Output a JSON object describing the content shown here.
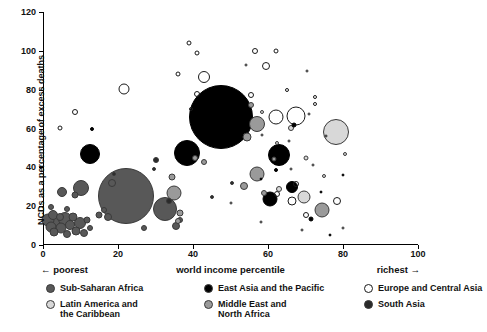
{
  "chart_data": {
    "type": "scatter",
    "title": "",
    "xlabel": "world income percentile",
    "ylabel": "NCDs as a percentage of excess deaths",
    "xlim": [
      0,
      100
    ],
    "ylim": [
      0,
      120
    ],
    "xticks": [
      0,
      20,
      40,
      60,
      80,
      100
    ],
    "yticks": [
      0,
      20,
      40,
      60,
      80,
      100,
      120
    ],
    "grid": false,
    "legend_position": "below",
    "axis_annotations": {
      "left": "← poorest",
      "right": "richest →"
    },
    "series": [
      {
        "name": "Sub-Saharan Africa",
        "color": "#585858",
        "filled": true,
        "points": [
          {
            "x": 1.2,
            "y": 13,
            "r": 6.5
          },
          {
            "x": 2.0,
            "y": 9.5,
            "r": 5.5
          },
          {
            "x": 2.6,
            "y": 15.5,
            "r": 5.0
          },
          {
            "x": 3.4,
            "y": 11,
            "r": 7.5
          },
          {
            "x": 3.0,
            "y": 6.5,
            "r": 4.5
          },
          {
            "x": 4.4,
            "y": 14.5,
            "r": 4.0
          },
          {
            "x": 4.9,
            "y": 8.5,
            "r": 5.5
          },
          {
            "x": 5.8,
            "y": 13.5,
            "r": 7.0
          },
          {
            "x": 6.3,
            "y": 5.5,
            "r": 4.0
          },
          {
            "x": 7.2,
            "y": 10.5,
            "r": 5.0
          },
          {
            "x": 8.0,
            "y": 14.5,
            "r": 4.5
          },
          {
            "x": 8.8,
            "y": 7.0,
            "r": 4.5
          },
          {
            "x": 9.8,
            "y": 11.5,
            "r": 6.0
          },
          {
            "x": 10.8,
            "y": 6.0,
            "r": 4.0
          },
          {
            "x": 11.6,
            "y": 13.0,
            "r": 3.5
          },
          {
            "x": 12.6,
            "y": 9.0,
            "r": 3.0
          },
          {
            "x": 2.2,
            "y": 19.5,
            "r": 3.0
          },
          {
            "x": 6.5,
            "y": 18.5,
            "r": 3.0
          },
          {
            "x": 5.0,
            "y": 27.5,
            "r": 5.0
          },
          {
            "x": 8.4,
            "y": 26.0,
            "r": 3.5
          },
          {
            "x": 10.0,
            "y": 29.5,
            "r": 8.0
          },
          {
            "x": 15.0,
            "y": 15.5,
            "r": 3.5
          },
          {
            "x": 16.2,
            "y": 18.0,
            "r": 3.0
          },
          {
            "x": 17.4,
            "y": 14.5,
            "r": 4.0
          },
          {
            "x": 22.0,
            "y": 25.0,
            "r": 28.0
          },
          {
            "x": 27.0,
            "y": 9.0,
            "r": 3.0
          },
          {
            "x": 32.5,
            "y": 18.5,
            "r": 12.0
          },
          {
            "x": 35.5,
            "y": 10.0,
            "r": 4.0
          },
          {
            "x": 36.5,
            "y": 13.0,
            "r": 3.0
          },
          {
            "x": 18.5,
            "y": 32.0,
            "r": 4.0
          }
        ]
      },
      {
        "name": "East Asia and the Pacific",
        "color": "#000000",
        "filled": true,
        "points": [
          {
            "x": 13.0,
            "y": 59.5,
            "r": 2.0
          },
          {
            "x": 12.5,
            "y": 47.0,
            "r": 10.0
          },
          {
            "x": 38.5,
            "y": 47.5,
            "r": 13.0
          },
          {
            "x": 47.5,
            "y": 66.0,
            "r": 32.0
          },
          {
            "x": 63.0,
            "y": 46.5,
            "r": 11.0
          },
          {
            "x": 60.5,
            "y": 23.5,
            "r": 7.5
          },
          {
            "x": 66.5,
            "y": 30.0,
            "r": 6.0
          },
          {
            "x": 71.5,
            "y": 13.5,
            "r": 2.5
          },
          {
            "x": 76.5,
            "y": 5.0,
            "r": 1.5
          },
          {
            "x": 62.0,
            "y": 38.5,
            "r": 2.0
          },
          {
            "x": 67.0,
            "y": 62.0,
            "r": 2.5
          },
          {
            "x": 58.0,
            "y": 34.0,
            "r": 1.5
          },
          {
            "x": 74.0,
            "y": 27.5,
            "r": 1.5
          },
          {
            "x": 80.0,
            "y": 36.0,
            "r": 1.5
          }
        ]
      },
      {
        "name": "Europe and Central Asia",
        "color": "#ffffff",
        "filled": false,
        "points": [
          {
            "x": 4.5,
            "y": 60.5,
            "r": 2.5
          },
          {
            "x": 8.5,
            "y": 68.5,
            "r": 3.0
          },
          {
            "x": 21.5,
            "y": 80.5,
            "r": 5.5
          },
          {
            "x": 39.0,
            "y": 104.0,
            "r": 2.5
          },
          {
            "x": 41.0,
            "y": 99.0,
            "r": 2.5
          },
          {
            "x": 36.0,
            "y": 88.0,
            "r": 2.5
          },
          {
            "x": 43.0,
            "y": 86.5,
            "r": 6.0
          },
          {
            "x": 41.0,
            "y": 78.0,
            "r": 3.0
          },
          {
            "x": 39.5,
            "y": 70.0,
            "r": 2.0
          },
          {
            "x": 56.5,
            "y": 100.0,
            "r": 3.0
          },
          {
            "x": 62.0,
            "y": 100.0,
            "r": 2.5
          },
          {
            "x": 59.5,
            "y": 92.0,
            "r": 4.0
          },
          {
            "x": 54.0,
            "y": 92.5,
            "r": 1.5
          },
          {
            "x": 70.5,
            "y": 89.5,
            "r": 1.5
          },
          {
            "x": 55.5,
            "y": 77.5,
            "r": 3.0
          },
          {
            "x": 65.0,
            "y": 80.0,
            "r": 2.0
          },
          {
            "x": 72.5,
            "y": 76.0,
            "r": 2.0
          },
          {
            "x": 72.5,
            "y": 72.5,
            "r": 2.0
          },
          {
            "x": 71.0,
            "y": 67.5,
            "r": 1.5
          },
          {
            "x": 67.5,
            "y": 66.5,
            "r": 9.5
          },
          {
            "x": 62.0,
            "y": 66.0,
            "r": 7.5
          },
          {
            "x": 65.5,
            "y": 53.5,
            "r": 1.5
          },
          {
            "x": 75.5,
            "y": 56.0,
            "r": 1.5
          },
          {
            "x": 58.5,
            "y": 56.5,
            "r": 1.5
          },
          {
            "x": 62.5,
            "y": 26.5,
            "r": 3.0
          },
          {
            "x": 67.5,
            "y": 31.5,
            "r": 3.0
          },
          {
            "x": 66.5,
            "y": 22.5,
            "r": 4.5
          },
          {
            "x": 70.0,
            "y": 15.5,
            "r": 3.0
          },
          {
            "x": 78.5,
            "y": 22.5,
            "r": 4.0
          },
          {
            "x": 66.0,
            "y": 39.0,
            "r": 1.5
          },
          {
            "x": 72.0,
            "y": 41.0,
            "r": 1.5
          },
          {
            "x": 58.0,
            "y": 12.0,
            "r": 1.5
          },
          {
            "x": 50.0,
            "y": 21.5,
            "r": 1.5
          },
          {
            "x": 69.0,
            "y": 7.5,
            "r": 1.5
          },
          {
            "x": 80.0,
            "y": 8.5,
            "r": 1.5
          }
        ]
      },
      {
        "name": "Latin America and the Caribbean",
        "color": "#d8d8d8",
        "filled": true,
        "points": [
          {
            "x": 78.0,
            "y": 58.0,
            "r": 13.0
          },
          {
            "x": 69.5,
            "y": 24.5,
            "r": 6.5
          },
          {
            "x": 63.0,
            "y": 29.0,
            "r": 3.0
          },
          {
            "x": 66.0,
            "y": 60.5,
            "r": 3.0
          },
          {
            "x": 70.0,
            "y": 45.0,
            "r": 2.5
          },
          {
            "x": 75.0,
            "y": 35.5,
            "r": 2.0
          },
          {
            "x": 62.5,
            "y": 52.5,
            "r": 2.0
          },
          {
            "x": 80.5,
            "y": 47.0,
            "r": 2.0
          },
          {
            "x": 58.5,
            "y": 68.5,
            "r": 2.0
          }
        ]
      },
      {
        "name": "Middle East and North Africa",
        "color": "#9a9a9a",
        "filled": true,
        "points": [
          {
            "x": 34.5,
            "y": 35.0,
            "r": 3.5
          },
          {
            "x": 35.0,
            "y": 27.0,
            "r": 7.5
          },
          {
            "x": 36.5,
            "y": 16.5,
            "r": 3.5
          },
          {
            "x": 36.0,
            "y": 12.5,
            "r": 3.0
          },
          {
            "x": 40.5,
            "y": 45.0,
            "r": 3.0
          },
          {
            "x": 43.0,
            "y": 43.0,
            "r": 3.0
          },
          {
            "x": 57.0,
            "y": 62.5,
            "r": 8.0
          },
          {
            "x": 54.5,
            "y": 55.5,
            "r": 4.5
          },
          {
            "x": 55.5,
            "y": 72.0,
            "r": 3.0
          },
          {
            "x": 57.0,
            "y": 36.5,
            "r": 7.5
          },
          {
            "x": 53.5,
            "y": 30.5,
            "r": 4.0
          },
          {
            "x": 59.0,
            "y": 27.0,
            "r": 3.0
          },
          {
            "x": 74.5,
            "y": 18.0,
            "r": 7.5
          },
          {
            "x": 61.5,
            "y": 44.5,
            "r": 2.5
          }
        ]
      },
      {
        "name": "South Asia",
        "color": "#2a2a2a",
        "filled": true,
        "points": [
          {
            "x": 30.0,
            "y": 44.0,
            "r": 3.0
          },
          {
            "x": 33.5,
            "y": 22.5,
            "r": 3.0
          },
          {
            "x": 29.5,
            "y": 39.0,
            "r": 2.0
          },
          {
            "x": 45.0,
            "y": 24.5,
            "r": 2.0
          },
          {
            "x": 19.0,
            "y": 36.5,
            "r": 2.0
          },
          {
            "x": 50.5,
            "y": 32.0,
            "r": 2.0
          }
        ]
      }
    ]
  },
  "axis": {
    "y_title": "NCDs as a percentage of excess deaths",
    "x_title": "world income percentile",
    "poorest": "← poorest",
    "richest": "richest →",
    "y_labels": [
      "0",
      "20",
      "40",
      "60",
      "80",
      "100",
      "120"
    ],
    "x_labels": [
      "0",
      "20",
      "40",
      "60",
      "80",
      "100"
    ]
  },
  "legend": {
    "items": [
      {
        "label": "Sub-Saharan Africa",
        "color": "#585858",
        "filled": true
      },
      {
        "label": "East Asia and the Pacific",
        "color": "#000000",
        "filled": true
      },
      {
        "label": "Europe and Central Asia",
        "color": "#ffffff",
        "filled": false
      },
      {
        "label": "Latin America and\nthe Caribbean",
        "color": "#d8d8d8",
        "filled": true
      },
      {
        "label": "Middle East and\nNorth Africa",
        "color": "#9a9a9a",
        "filled": true
      },
      {
        "label": "South Asia",
        "color": "#2a2a2a",
        "filled": true
      }
    ]
  }
}
